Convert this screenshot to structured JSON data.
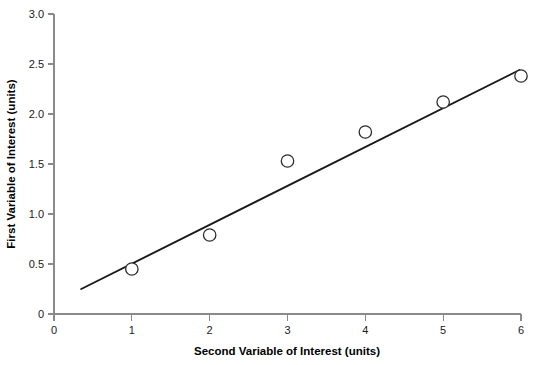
{
  "chart_data": {
    "type": "scatter",
    "title": "",
    "xlabel": "Second Variable of Interest (units)",
    "ylabel": "First Variable of Interest (units)",
    "xlim": [
      0,
      6
    ],
    "ylim": [
      0,
      3.0
    ],
    "xticks": [
      "0",
      "1",
      "2",
      "3",
      "4",
      "5",
      "6"
    ],
    "xtick_values": [
      0,
      1,
      2,
      3,
      4,
      5,
      6
    ],
    "yticks": [
      "0",
      "0.5",
      "1.0",
      "1.5",
      "2.0",
      "2.5",
      "3.0"
    ],
    "ytick_values": [
      0,
      0.5,
      1.0,
      1.5,
      2.0,
      2.5,
      3.0
    ],
    "grid": false,
    "legend": "none",
    "x": [
      1,
      2,
      3,
      4,
      5,
      6
    ],
    "values": [
      0.45,
      0.79,
      1.53,
      1.82,
      2.12,
      2.38
    ],
    "series": [
      {
        "name": "observations",
        "marker": "open-circle",
        "x": [
          1,
          2,
          3,
          4,
          5,
          6
        ],
        "values": [
          0.45,
          0.79,
          1.53,
          1.82,
          2.12,
          2.38
        ]
      }
    ],
    "trendline": {
      "type": "line",
      "x_start": 0.35,
      "y_start": 0.25,
      "x_end": 5.98,
      "y_end": 2.44,
      "slope": 0.389,
      "intercept": 0.114
    },
    "colors": {
      "axis": "#8a8a8a",
      "marker_stroke": "#2b2b2b",
      "marker_fill": "#ffffff",
      "line": "#1a1a1a",
      "text": "#000000",
      "background": "#ffffff"
    }
  }
}
